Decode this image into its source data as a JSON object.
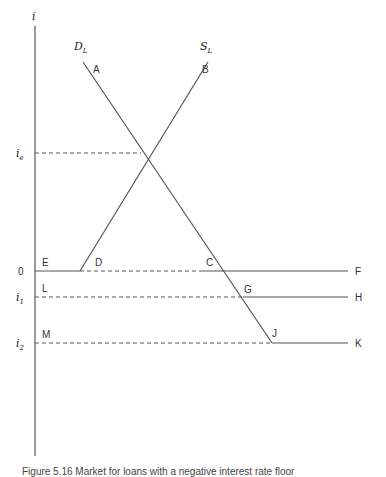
{
  "diagram": {
    "axis": {
      "label": "i"
    },
    "curves": {
      "demand": {
        "label_main": "D",
        "label_sub": "L",
        "start_point": "A",
        "end_point": "J"
      },
      "supply": {
        "label_main": "S",
        "label_sub": "L",
        "start_point": "D",
        "end_point": "B"
      }
    },
    "rate_levels": [
      {
        "id": "ie",
        "label_main": "i",
        "label_sub": "e"
      },
      {
        "id": "zero",
        "label_main": "0",
        "label_sub": ""
      },
      {
        "id": "i1",
        "label_main": "i",
        "label_sub": "1"
      },
      {
        "id": "i2",
        "label_main": "i",
        "label_sub": "2"
      }
    ],
    "points": {
      "A": "A",
      "B": "B",
      "C": "C",
      "D": "D",
      "E": "E",
      "F": "F",
      "G": "G",
      "H": "H",
      "J": "J",
      "K": "K",
      "L": "L",
      "M": "M"
    },
    "line_color": "#555555",
    "caption": "Figure 5.16 Market for loans with a negative interest rate floor"
  }
}
